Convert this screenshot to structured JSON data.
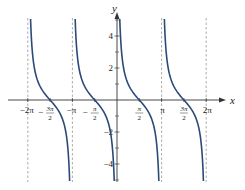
{
  "chart_data": {
    "type": "line",
    "title": "",
    "function": "y = cot(x)",
    "xlabel": "x",
    "ylabel": "y",
    "xlim": [
      -6.6,
      7.3
    ],
    "ylim": [
      -5,
      5
    ],
    "grid": false,
    "legend": null,
    "x_ticks": [
      {
        "value": -6.2832,
        "label": "−2π"
      },
      {
        "value": -4.7124,
        "label": "−3π/2"
      },
      {
        "value": -3.1416,
        "label": "−π"
      },
      {
        "value": -1.5708,
        "label": "−π/2"
      },
      {
        "value": 1.5708,
        "label": "π/2"
      },
      {
        "value": 3.1416,
        "label": "π"
      },
      {
        "value": 4.7124,
        "label": "3π/2"
      },
      {
        "value": 6.2832,
        "label": "2π"
      }
    ],
    "y_ticks": [
      {
        "value": 4,
        "label": "4"
      },
      {
        "value": 2,
        "label": "2"
      },
      {
        "value": -2,
        "label": "−2"
      },
      {
        "value": -4,
        "label": "−4"
      }
    ],
    "y_minor_ticks": [
      5,
      3,
      1,
      -1,
      -3,
      -5
    ],
    "asymptotes": [
      -6.2832,
      -3.1416,
      3.1416,
      6.2832
    ],
    "branches": [
      {
        "from": -6.2832,
        "to": -3.1416,
        "zero": -4.7124
      },
      {
        "from": -3.1416,
        "to": 0,
        "zero": -1.5708
      },
      {
        "from": 0,
        "to": 3.1416,
        "zero": 1.5708
      },
      {
        "from": 3.1416,
        "to": 6.2832,
        "zero": 4.7124
      }
    ],
    "colors": {
      "curve": "#2b4a78",
      "axis": "#333333",
      "asymptote": "#888888"
    }
  },
  "axes": {
    "x_label": "x",
    "y_label": "y"
  }
}
